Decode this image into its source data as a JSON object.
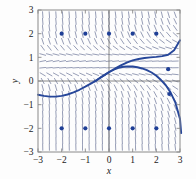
{
  "figure": {
    "kind": "slope-field-with-solution-curves",
    "background": "#fdfdfd",
    "frame": {
      "left": 38,
      "top": 10,
      "right": 180,
      "bottom": 152
    },
    "frame_color": "#8a8a8a",
    "accent_curve_color": "#27479a",
    "slope_color": "#57618a",
    "dot_color": "#1f3f96",
    "axis_color": "#6b6b6b"
  },
  "axes": {
    "x": {
      "label": "x",
      "min": -3,
      "max": 3,
      "ticks": [
        -3,
        -2,
        -1,
        0,
        1,
        2,
        3
      ],
      "tick_labels": [
        "−3",
        "−2",
        "−1",
        "0",
        "1",
        "2",
        "3"
      ]
    },
    "y": {
      "label": "y",
      "min": -3,
      "max": 3,
      "ticks": [
        -3,
        -2,
        -1,
        0,
        1,
        2,
        3
      ],
      "tick_labels": [
        "−3",
        "−2",
        "−1",
        "0",
        "1",
        "2",
        "3"
      ]
    }
  },
  "chart_data": {
    "type": "line",
    "title": "",
    "xlabel": "x",
    "ylabel": "y",
    "xlim": [
      -3,
      3
    ],
    "ylim": [
      -3,
      3
    ],
    "grid": false,
    "legend": "none",
    "slope_field": {
      "description": "short line segments showing dy/dx on a regular lattice",
      "x_start": -2.8,
      "x_step": 0.28,
      "x_count": 21,
      "y_start": -2.8,
      "y_step": 0.28,
      "y_count": 21,
      "segment_length_px": 6,
      "equilibria_y": [
        1.0,
        0.5
      ]
    },
    "series": [
      {
        "name": "solution-curve-upper",
        "points": [
          [
            -3.0,
            -0.58
          ],
          [
            -2.75,
            -0.63
          ],
          [
            -2.5,
            -0.66
          ],
          [
            -2.25,
            -0.66
          ],
          [
            -2.0,
            -0.63
          ],
          [
            -1.75,
            -0.57
          ],
          [
            -1.5,
            -0.48
          ],
          [
            -1.25,
            -0.37
          ],
          [
            -1.0,
            -0.24
          ],
          [
            -0.75,
            -0.1
          ],
          [
            -0.5,
            0.05
          ],
          [
            -0.25,
            0.21
          ],
          [
            0.0,
            0.37
          ],
          [
            0.25,
            0.52
          ],
          [
            0.5,
            0.66
          ],
          [
            0.75,
            0.78
          ],
          [
            1.0,
            0.87
          ],
          [
            1.25,
            0.93
          ],
          [
            1.5,
            0.97
          ],
          [
            1.75,
            1.0
          ],
          [
            2.0,
            1.02
          ],
          [
            2.25,
            1.05
          ],
          [
            2.5,
            1.11
          ],
          [
            2.75,
            1.3
          ],
          [
            3.0,
            1.72
          ]
        ]
      },
      {
        "name": "solution-curve-lower",
        "points": [
          [
            -0.6,
            -0.02
          ],
          [
            -0.4,
            0.12
          ],
          [
            -0.2,
            0.25
          ],
          [
            0.0,
            0.38
          ],
          [
            0.2,
            0.48
          ],
          [
            0.4,
            0.56
          ],
          [
            0.6,
            0.6
          ],
          [
            0.8,
            0.62
          ],
          [
            1.0,
            0.61
          ],
          [
            1.2,
            0.58
          ],
          [
            1.4,
            0.53
          ],
          [
            1.6,
            0.46
          ],
          [
            1.8,
            0.36
          ],
          [
            2.0,
            0.22
          ],
          [
            2.2,
            0.04
          ],
          [
            2.4,
            -0.18
          ],
          [
            2.6,
            -0.48
          ],
          [
            2.8,
            -0.9
          ],
          [
            3.0,
            -1.6
          ],
          [
            3.05,
            -2.2
          ]
        ]
      }
    ],
    "markers": {
      "name": "lattice-dots",
      "color": "#1f3f96",
      "radius_px": 2.1,
      "points": [
        [
          -2,
          2
        ],
        [
          -1,
          2
        ],
        [
          0,
          2
        ],
        [
          1,
          2
        ],
        [
          2,
          2
        ],
        [
          -2,
          -2
        ],
        [
          -1,
          -2
        ],
        [
          0,
          -2
        ],
        [
          1,
          -2
        ],
        [
          2,
          -2
        ],
        [
          2.5,
          0.5
        ],
        [
          2.55,
          -0.55
        ]
      ]
    }
  }
}
